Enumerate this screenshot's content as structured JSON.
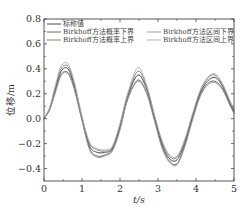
{
  "chart_data": {
    "type": "line",
    "title": "",
    "xlabel": "t/s",
    "ylabel": "位移/m",
    "xlim": [
      0,
      5
    ],
    "ylim": [
      -0.5,
      0.8
    ],
    "xticks": [
      0,
      1,
      2,
      3,
      4,
      5
    ],
    "xtick_labels": [
      "0",
      "1",
      "2",
      "3",
      "4",
      "5"
    ],
    "yticks": [
      -0.4,
      -0.2,
      0.0,
      0.2,
      0.4,
      0.6,
      0.8
    ],
    "ytick_labels": [
      "−0.4",
      "−0.2",
      "0.0",
      "0.2",
      "0.4",
      "0.6",
      "0.8"
    ],
    "grid": false,
    "legend_position": "upper",
    "x": [
      0,
      0.15,
      0.3,
      0.45,
      0.63,
      0.8,
      1.0,
      1.2,
      1.4,
      1.6,
      1.8,
      2.0,
      2.2,
      2.47,
      2.7,
      2.9,
      3.1,
      3.3,
      3.5,
      3.7,
      3.9,
      4.1,
      4.3,
      4.5,
      4.7,
      4.9,
      5.0
    ],
    "series": [
      {
        "name": "标称值",
        "color": "#333333",
        "values": [
          0,
          0.08,
          0.24,
          0.38,
          0.4,
          0.26,
          0.0,
          -0.22,
          -0.27,
          -0.27,
          -0.24,
          -0.06,
          0.18,
          0.35,
          0.24,
          0.02,
          -0.2,
          -0.32,
          -0.33,
          -0.2,
          0.01,
          0.2,
          0.3,
          0.33,
          0.26,
          0.12,
          0.06
        ]
      },
      {
        "name": "Birkhoff方法概率下界",
        "color": "#555555",
        "values": [
          0,
          0.075,
          0.22,
          0.355,
          0.37,
          0.24,
          -0.01,
          -0.24,
          -0.3,
          -0.29,
          -0.25,
          -0.08,
          0.16,
          0.31,
          0.21,
          0.0,
          -0.22,
          -0.34,
          -0.36,
          -0.22,
          -0.01,
          0.18,
          0.28,
          0.3,
          0.24,
          0.11,
          0.05
        ]
      },
      {
        "name": "Birkhoff方法区间下界",
        "color": "#999999",
        "values": [
          0,
          0.072,
          0.21,
          0.345,
          0.36,
          0.23,
          -0.015,
          -0.25,
          -0.31,
          -0.3,
          -0.26,
          -0.09,
          0.15,
          0.3,
          0.2,
          -0.01,
          -0.23,
          -0.35,
          -0.37,
          -0.23,
          -0.02,
          0.17,
          0.27,
          0.29,
          0.23,
          0.1,
          0.04
        ]
      },
      {
        "name": "Birkhoff方法概率上界",
        "color": "#777777",
        "values": [
          0,
          0.085,
          0.255,
          0.4,
          0.42,
          0.28,
          0.01,
          -0.2,
          -0.25,
          -0.26,
          -0.23,
          -0.05,
          0.19,
          0.38,
          0.26,
          0.03,
          -0.18,
          -0.3,
          -0.31,
          -0.18,
          0.02,
          0.21,
          0.32,
          0.35,
          0.27,
          0.13,
          0.07
        ]
      },
      {
        "name": "Birkhoff方法区间上界",
        "color": "#aaaaaa",
        "values": [
          0,
          0.09,
          0.265,
          0.42,
          0.44,
          0.29,
          0.02,
          -0.19,
          -0.24,
          -0.25,
          -0.22,
          -0.04,
          0.2,
          0.41,
          0.27,
          0.04,
          -0.17,
          -0.29,
          -0.3,
          -0.17,
          0.03,
          0.22,
          0.33,
          0.36,
          0.28,
          0.14,
          0.08
        ]
      }
    ],
    "legend": [
      {
        "label": "标称值",
        "color": "#333333",
        "col": 0,
        "row": 0
      },
      {
        "label": "Birkhoff方法概率下界",
        "color": "#555555",
        "col": 0,
        "row": 1
      },
      {
        "label": "Birkhoff方法区间下界",
        "color": "#999999",
        "col": 1,
        "row": 1
      },
      {
        "label": "Birkhoff方法概率上界",
        "color": "#777777",
        "col": 0,
        "row": 2
      },
      {
        "label": "Birkhoff方法区间上界",
        "color": "#aaaaaa",
        "col": 1,
        "row": 2
      }
    ]
  }
}
